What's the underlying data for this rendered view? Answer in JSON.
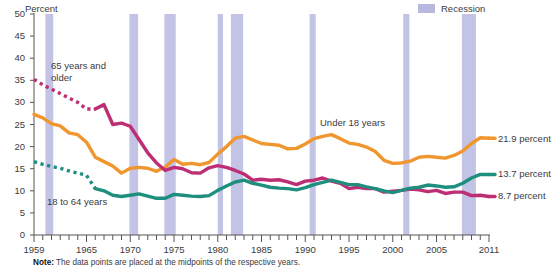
{
  "chart_data": {
    "type": "line",
    "title": "",
    "ylabel": "Percent",
    "xlabel": "",
    "ylim": [
      0,
      50
    ],
    "xlim": [
      1959,
      2011
    ],
    "yticks": [
      0,
      5,
      10,
      15,
      20,
      25,
      30,
      35,
      40,
      45,
      50
    ],
    "xticks_labeled": [
      1959,
      1965,
      1970,
      1975,
      1980,
      1985,
      1990,
      1995,
      2000,
      2005,
      2011
    ],
    "grid": false,
    "legend_position": "top-right",
    "x": [
      1959,
      1960,
      1961,
      1962,
      1963,
      1964,
      1965,
      1966,
      1967,
      1968,
      1969,
      1970,
      1971,
      1972,
      1973,
      1974,
      1975,
      1976,
      1977,
      1978,
      1979,
      1980,
      1981,
      1982,
      1983,
      1984,
      1985,
      1986,
      1987,
      1988,
      1989,
      1990,
      1991,
      1992,
      1993,
      1994,
      1995,
      1996,
      1997,
      1998,
      1999,
      2000,
      2001,
      2002,
      2003,
      2004,
      2005,
      2006,
      2007,
      2008,
      2009,
      2010,
      2011
    ],
    "series": [
      {
        "name": "Under 18 years",
        "color": "#F0962E",
        "label_text": "Under 18 years",
        "end_value": 21.9,
        "end_label": "21.9 percent",
        "style": "solid",
        "values": [
          27.3,
          26.5,
          25.2,
          24.7,
          23.1,
          22.7,
          21.0,
          17.6,
          16.6,
          15.6,
          14.0,
          15.1,
          15.3,
          15.1,
          14.4,
          15.4,
          17.1,
          16.0,
          16.2,
          15.9,
          16.4,
          18.3,
          20.0,
          21.9,
          22.3,
          21.5,
          20.7,
          20.5,
          20.3,
          19.5,
          19.6,
          20.6,
          21.8,
          22.3,
          22.7,
          21.8,
          20.8,
          20.5,
          19.9,
          18.9,
          16.9,
          16.2,
          16.3,
          16.7,
          17.6,
          17.8,
          17.6,
          17.4,
          18.0,
          19.0,
          20.7,
          22.0,
          21.9
        ]
      },
      {
        "name": "65 years and older",
        "color": "#BE2E74",
        "label_text": "65 years and older",
        "end_value": 8.7,
        "end_label": "8.7 percent",
        "style": "dotted-then-solid",
        "solid_from": 1966,
        "values": [
          35.2,
          34.0,
          33.0,
          32.0,
          31.0,
          30.0,
          28.5,
          28.5,
          29.5,
          25.0,
          25.3,
          24.6,
          21.6,
          18.6,
          16.3,
          14.6,
          15.3,
          15.0,
          14.1,
          14.0,
          15.2,
          15.7,
          15.3,
          14.6,
          13.8,
          12.4,
          12.6,
          12.4,
          12.5,
          12.0,
          11.4,
          12.2,
          12.4,
          12.9,
          12.2,
          11.7,
          10.5,
          10.8,
          10.5,
          10.5,
          9.7,
          9.9,
          10.1,
          10.4,
          10.2,
          9.8,
          10.1,
          9.4,
          9.7,
          9.7,
          8.9,
          9.0,
          8.7
        ]
      },
      {
        "name": "18 to 64 years",
        "color": "#1E8F7E",
        "label_text": "18 to 64 years",
        "end_value": 13.7,
        "end_label": "13.7 percent",
        "style": "dotted-then-solid",
        "solid_from": 1966,
        "values": [
          16.6,
          16.0,
          15.5,
          15.1,
          14.5,
          14.0,
          13.5,
          10.5,
          10.0,
          9.0,
          8.7,
          9.0,
          9.3,
          8.8,
          8.3,
          8.3,
          9.2,
          9.0,
          8.8,
          8.7,
          8.9,
          10.1,
          11.1,
          12.0,
          12.4,
          11.7,
          11.3,
          10.8,
          10.6,
          10.5,
          10.2,
          10.7,
          11.4,
          11.9,
          12.4,
          11.9,
          11.4,
          11.4,
          10.9,
          10.5,
          10.0,
          9.6,
          10.1,
          10.6,
          10.8,
          11.3,
          11.1,
          10.8,
          10.9,
          11.7,
          12.9,
          13.7,
          13.7
        ]
      }
    ],
    "recessions": [
      {
        "start": 1960.3,
        "end": 1961.2
      },
      {
        "start": 1969.9,
        "end": 1970.9
      },
      {
        "start": 1973.9,
        "end": 1975.2
      },
      {
        "start": 1980.0,
        "end": 1980.6
      },
      {
        "start": 1981.5,
        "end": 1982.9
      },
      {
        "start": 1990.5,
        "end": 1991.2
      },
      {
        "start": 2001.2,
        "end": 2001.9
      },
      {
        "start": 2007.9,
        "end": 2009.5
      }
    ],
    "recession_color": "#b9b9e0"
  },
  "axis": {
    "y_title": "Percent",
    "y_labels": [
      "50",
      "45",
      "40",
      "35",
      "30",
      "25",
      "20",
      "15",
      "10",
      "5",
      "0"
    ],
    "x_labels": [
      "1959",
      "1965",
      "1970",
      "1975",
      "1980",
      "1985",
      "1990",
      "1995",
      "2000",
      "2005",
      "2011"
    ]
  },
  "legend": {
    "recession_label": "Recession"
  },
  "annotations": {
    "series_65": "65 years and\nolder",
    "series_65_line1": "65 years and",
    "series_65_line2": "older",
    "series_18_64": "18 to 64 years",
    "series_under18": "Under 18 years",
    "end_orange": "21.9 percent",
    "end_teal": "13.7 percent",
    "end_magenta": "8.7 percent"
  },
  "note": {
    "prefix": "Note:",
    "text": "The data  points are  placed  at the midpoints of the respective years."
  }
}
